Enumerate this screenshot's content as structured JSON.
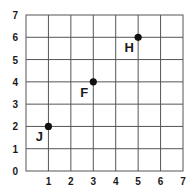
{
  "chart_data": {
    "type": "scatter",
    "title": "",
    "xlabel": "",
    "ylabel": "",
    "xlim": [
      0,
      7
    ],
    "ylim": [
      0,
      7
    ],
    "grid": true,
    "x_ticks": [
      "1",
      "2",
      "3",
      "4",
      "5",
      "6",
      "7"
    ],
    "y_ticks": [
      "0",
      "1",
      "2",
      "3",
      "4",
      "5",
      "6",
      "7"
    ],
    "points": [
      {
        "label": "J",
        "x": 1,
        "y": 2,
        "label_position": "below-left"
      },
      {
        "label": "F",
        "x": 3,
        "y": 4,
        "label_position": "below-left"
      },
      {
        "label": "H",
        "x": 5,
        "y": 6,
        "label_position": "below-left"
      }
    ]
  }
}
